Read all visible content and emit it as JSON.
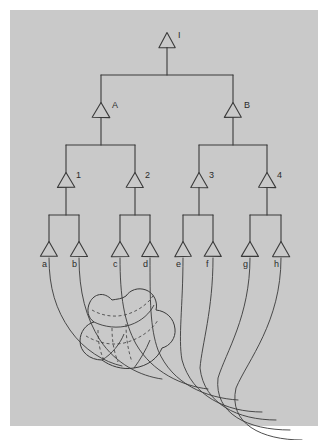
{
  "figure": {
    "kind": "hand-drawn-hierarchy-diagram",
    "background_color": "#ffffff",
    "panel_color": "#c9c9c9",
    "ink_color": "#3a3a3a",
    "panel": {
      "x": 10,
      "y": 10,
      "width": 308,
      "height": 416
    }
  },
  "tree": {
    "levels": [
      {
        "name": "root",
        "nodes": [
          {
            "id": "I",
            "label": "I",
            "cx": 167,
            "cy": 40,
            "label_dx": 11,
            "label_dy": -9
          }
        ]
      },
      {
        "name": "level-1",
        "nodes": [
          {
            "id": "A",
            "label": "A",
            "cx": 101,
            "cy": 110,
            "label_dx": 11,
            "label_dy": -9
          },
          {
            "id": "B",
            "label": "B",
            "cx": 233,
            "cy": 110,
            "label_dx": 11,
            "label_dy": -9
          }
        ]
      },
      {
        "name": "level-2",
        "nodes": [
          {
            "id": "1",
            "label": "1",
            "cx": 66,
            "cy": 180,
            "label_dx": 10,
            "label_dy": -9
          },
          {
            "id": "2",
            "label": "2",
            "cx": 135,
            "cy": 180,
            "label_dx": 10,
            "label_dy": -9
          },
          {
            "id": "3",
            "label": "3",
            "cx": 199,
            "cy": 180,
            "label_dx": 10,
            "label_dy": -9
          },
          {
            "id": "4",
            "label": "4",
            "cx": 267,
            "cy": 180,
            "label_dx": 10,
            "label_dy": -9
          }
        ]
      },
      {
        "name": "leaves",
        "nodes": [
          {
            "id": "a",
            "label": "a",
            "cx": 49,
            "cy": 249,
            "label_dx": -3,
            "label_dy": 3
          },
          {
            "id": "b",
            "label": "b",
            "cx": 79,
            "cy": 249,
            "label_dx": -3,
            "label_dy": 3
          },
          {
            "id": "c",
            "label": "c",
            "cx": 120,
            "cy": 249,
            "label_dx": -3,
            "label_dy": 3
          },
          {
            "id": "d",
            "label": "d",
            "cx": 150,
            "cy": 249,
            "label_dx": -3,
            "label_dy": 3
          },
          {
            "id": "e",
            "label": "e",
            "cx": 183,
            "cy": 249,
            "label_dx": -3,
            "label_dy": 3
          },
          {
            "id": "f",
            "label": "f",
            "cx": 213,
            "cy": 249,
            "label_dx": -3,
            "label_dy": 3
          },
          {
            "id": "g",
            "label": "g",
            "cx": 250,
            "cy": 249,
            "label_dx": -3,
            "label_dy": 3
          },
          {
            "id": "h",
            "label": "h",
            "cx": 281,
            "cy": 249,
            "label_dx": -3,
            "label_dy": 3
          }
        ]
      }
    ],
    "edges": [
      {
        "from": "I",
        "to": "A"
      },
      {
        "from": "I",
        "to": "B"
      },
      {
        "from": "A",
        "to": "1"
      },
      {
        "from": "A",
        "to": "2"
      },
      {
        "from": "B",
        "to": "3"
      },
      {
        "from": "B",
        "to": "4"
      },
      {
        "from": "1",
        "to": "a"
      },
      {
        "from": "1",
        "to": "b"
      },
      {
        "from": "2",
        "to": "c"
      },
      {
        "from": "2",
        "to": "d"
      },
      {
        "from": "3",
        "to": "e"
      },
      {
        "from": "3",
        "to": "f"
      },
      {
        "from": "4",
        "to": "g"
      },
      {
        "from": "4",
        "to": "h"
      }
    ]
  },
  "flow_curves": {
    "description": "curved strands leaving each leaf and sweeping into the blob at lower-left",
    "from_leaves": [
      "a",
      "b",
      "c",
      "d",
      "e",
      "f",
      "g",
      "h"
    ],
    "paths": [
      "M49,258 C49,288 56,310 70,330 C84,350 104,362 122,366",
      "M79,258 C79,292 86,318 100,340 C116,364 140,376 162,379",
      "M120,258 C120,296 124,322 136,344 C152,372 182,386 208,389",
      "M150,258 C150,300 150,328 158,350 C172,384 206,398 238,400",
      "M183,258 C183,306 178,338 182,360 C192,396 226,412 262,412",
      "M213,258 C213,310 202,344 200,368 C204,404 238,420 276,420",
      "M250,258 C250,316 226,352 218,378 C214,414 248,430 290,430",
      "M281,258 C281,322 248,360 236,388 C228,424 262,440 302,440"
    ]
  },
  "blob": {
    "description": "3D interlocking solid with dashed hidden edges",
    "outline": "M112,300 C104,291 94,294 90,302 C86,310 88,318 94,322 C86,324 80,332 80,341 C80,352 90,360 102,360 C110,366 122,370 134,368 C148,366 158,358 162,348 C170,346 176,338 175,329 C174,318 166,311 156,310 C158,302 154,293 146,290 C138,287 130,290 126,296 C122,299 117,299 112,300 Z",
    "solid_edges": [
      "M94,322 C104,327 118,329 130,325 C142,321 150,313 154,305",
      "M102,360 C112,354 120,344 124,334",
      "M134,368 C140,360 146,350 150,340"
    ],
    "dashed_edges": [
      "M92,310 C102,316 116,318 128,314 C140,310 150,302 154,294",
      "M86,336 C96,342 110,346 124,343 C140,339 152,330 158,320",
      "M98,330 C98,342 100,352 104,360",
      "M112,328 C112,341 114,352 118,362",
      "M126,324 C126,338 128,350 132,362"
    ]
  }
}
